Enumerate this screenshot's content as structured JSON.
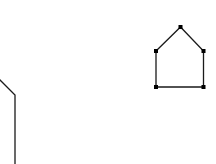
{
  "canvas": {
    "width": 216,
    "height": 164,
    "background": "#ffffff"
  },
  "style": {
    "stroke": "#1a1a1a",
    "stroke_width": 1.3,
    "vertex_color": "#000000",
    "vertex_size": 4
  },
  "shapes": [
    {
      "name": "house-polygon",
      "closed": true,
      "points": [
        [
          156,
          51
        ],
        [
          180.5,
          27
        ],
        [
          203.5,
          51
        ],
        [
          203.5,
          87
        ],
        [
          156,
          87
        ]
      ],
      "show_vertices": true
    },
    {
      "name": "partial-polyline-left",
      "closed": false,
      "points": [
        [
          -2,
          78
        ],
        [
          15,
          95
        ],
        [
          15,
          166
        ]
      ],
      "show_vertices": false
    }
  ]
}
